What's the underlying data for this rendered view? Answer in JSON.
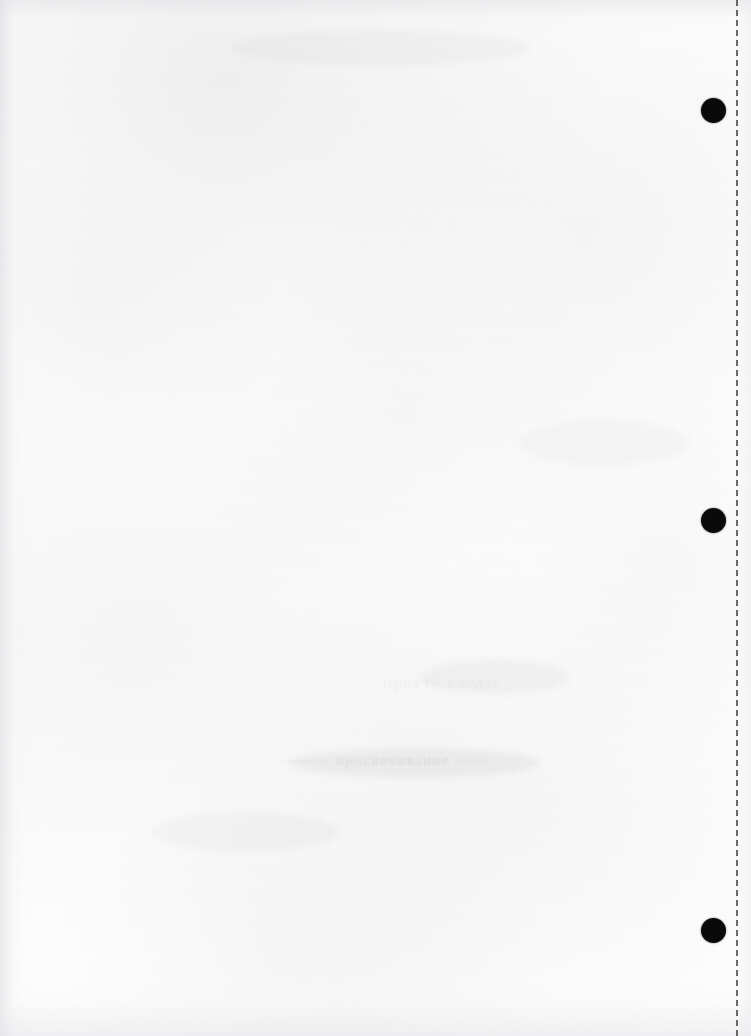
{
  "page": {
    "kind": "scanned-blank-page",
    "width": 751,
    "height": 1036,
    "paper_color": "#fdfdfd",
    "ink_color": "#0a0a0a",
    "visible_text": ""
  },
  "punch_holes": [
    {
      "name": "punch-hole-top",
      "cx": 713,
      "cy": 110,
      "diameter": 25
    },
    {
      "name": "punch-hole-middle",
      "cx": 713,
      "cy": 520,
      "diameter": 25
    },
    {
      "name": "punch-hole-bottom",
      "cx": 713,
      "cy": 930,
      "diameter": 25
    }
  ],
  "guide_line": {
    "name": "dashed-guide-line",
    "x": 736,
    "style": "dashed",
    "color": "#4a4a4a",
    "thickness": 2,
    "dash_length": 10,
    "gap_length": 9,
    "orientation": "vertical"
  },
  "bleed_through": [
    {
      "name": "ghost-line-upper",
      "x": 383,
      "y": 672,
      "width": 200,
      "height": 26,
      "text": "просто следы",
      "size": 17,
      "strength": "faint"
    },
    {
      "name": "ghost-line-main",
      "x": 281,
      "y": 752,
      "width": 262,
      "height": 24,
      "text": "——— просвечивание ——",
      "size": 15,
      "strength": "strong"
    },
    {
      "name": "ghost-line-lower",
      "x": 300,
      "y": 790,
      "width": 180,
      "height": 20,
      "text": "· · · · ·",
      "size": 13,
      "strength": "faint"
    }
  ],
  "smudges": [
    {
      "name": "smudge-upper-center",
      "x": 420,
      "y": 660,
      "width": 150,
      "height": 34,
      "opacity": 0.03
    },
    {
      "name": "smudge-mid-center",
      "x": 290,
      "y": 748,
      "width": 250,
      "height": 30,
      "opacity": 0.042
    },
    {
      "name": "smudge-lower-left",
      "x": 150,
      "y": 812,
      "width": 190,
      "height": 40,
      "opacity": 0.022
    },
    {
      "name": "smudge-top-band",
      "x": 230,
      "y": 30,
      "width": 300,
      "height": 36,
      "opacity": 0.024
    },
    {
      "name": "smudge-right-mid",
      "x": 520,
      "y": 420,
      "width": 170,
      "height": 46,
      "opacity": 0.02
    }
  ]
}
